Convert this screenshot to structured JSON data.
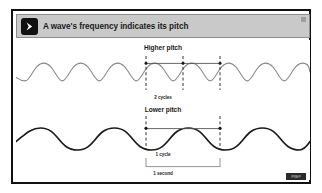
{
  "slide": {
    "header": {
      "icon": "play-arrow-icon",
      "title": "A wave's frequency indicates its pitch",
      "corner_mark": "resize-handle-mark",
      "background_color": "#c9c9c9",
      "icon_background_color": "#111111"
    },
    "watermark": {
      "text": "PREP",
      "background_color": "#2b2b2b"
    },
    "frame_border_color": "#111111",
    "canvas_background_color": "#ffffff"
  },
  "diagram": {
    "labels": {
      "higher_pitch": "Higher pitch",
      "two_cycles": "2 cycles",
      "lower_pitch": "Lower pitch",
      "one_cycle": "1 cycle",
      "one_second": "1 second"
    },
    "waves": [
      {
        "name": "higher-pitch-wave",
        "label": "Higher pitch",
        "cycles_in_interval": 2,
        "cycles_label": "2 cycles",
        "color": "#8a8a8a",
        "stroke_width": 1.1,
        "amplitude": 9,
        "wavelength": 37,
        "baseline_y": 32,
        "phase_peak_x": 130
      },
      {
        "name": "lower-pitch-wave",
        "label": "Lower pitch",
        "cycles_in_interval": 1,
        "cycles_label": "1 cycle",
        "color": "#1b1b1b",
        "stroke_width": 1.7,
        "amplitude": 11,
        "wavelength": 74,
        "baseline_y": 99,
        "phase_peak_x": 130
      }
    ],
    "markers": {
      "upper_dashed_x": [
        130,
        167,
        204
      ],
      "lower_dashed_x": [
        130,
        204
      ],
      "dash_color": "#1b1b1b",
      "peak_dot_color": "#1b1b1b",
      "connector_color": "#555555"
    },
    "time_bracket": {
      "label": "1 second",
      "start_x": 130,
      "end_x": 204,
      "y": 126,
      "color": "#8a8a8a"
    }
  }
}
